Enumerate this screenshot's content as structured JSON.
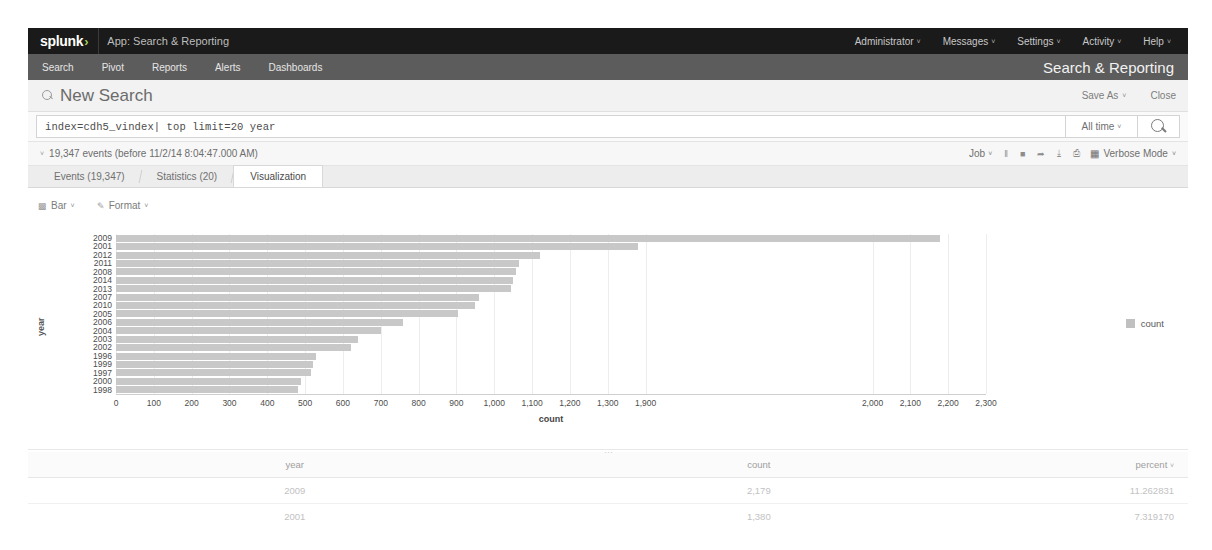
{
  "appbar": {
    "logo": "splunk",
    "logo_caret": "›",
    "app_label": "App: Search & Reporting",
    "right_items": [
      {
        "label": "Administrator",
        "caret": "˅"
      },
      {
        "label": "Messages",
        "caret": "˅"
      },
      {
        "label": "Settings",
        "caret": "˅"
      },
      {
        "label": "Activity",
        "caret": "˅"
      },
      {
        "label": "Help",
        "caret": "˅"
      }
    ]
  },
  "subnav": {
    "items": [
      {
        "label": "Search"
      },
      {
        "label": "Pivot"
      },
      {
        "label": "Reports"
      },
      {
        "label": "Alerts"
      },
      {
        "label": "Dashboards"
      }
    ],
    "app_title": "Search & Reporting"
  },
  "title_row": {
    "title": "New Search",
    "search_icon": "search-icon",
    "save_as": "Save As",
    "save_as_caret": "˅",
    "close": "Close"
  },
  "search": {
    "query": "index=cdh5_vindex| top limit=20 year",
    "time_range": "All time",
    "time_caret": "˅",
    "search_button_icon": "search-icon"
  },
  "results_header": {
    "expand_caret": "˅",
    "event_count_text": "19,347 events (before 11/2/14 8:04:47.000 AM)",
    "job_label": "Job",
    "job_caret": "˅",
    "controls": [
      {
        "icon": "pause-icon",
        "glyph": "‖"
      },
      {
        "icon": "stop-icon",
        "glyph": "■"
      },
      {
        "icon": "share-icon",
        "glyph": "➦"
      },
      {
        "icon": "export-icon",
        "glyph": "⤓"
      },
      {
        "icon": "print-icon",
        "glyph": "⎙"
      }
    ],
    "mode_icon": "grid-icon",
    "mode_label": "Verbose Mode",
    "mode_caret": "˅"
  },
  "tabs": [
    {
      "label": "Events (19,347)",
      "active": false
    },
    {
      "label": "Statistics (20)",
      "active": false
    },
    {
      "label": "Visualization",
      "active": true
    }
  ],
  "chart_toolbar": [
    {
      "icon": "bar-chart-icon",
      "label": "Bar",
      "caret": "˅"
    },
    {
      "icon": "format-icon",
      "label": "Format",
      "caret": "˅"
    }
  ],
  "chart_data": {
    "type": "bar",
    "orientation": "horizontal",
    "title": "",
    "xlabel": "count",
    "ylabel": "year",
    "xlim": [
      0,
      2300
    ],
    "grid": true,
    "legend_position": "right",
    "legend": [
      "count"
    ],
    "series_color": "#c8c8c8",
    "categories": [
      "2009",
      "2001",
      "2012",
      "2011",
      "2008",
      "2014",
      "2013",
      "2007",
      "2010",
      "2005",
      "2006",
      "2004",
      "2003",
      "2002",
      "1996",
      "1999",
      "1997",
      "2000",
      "1998"
    ],
    "values": [
      2179,
      1380,
      1120,
      1065,
      1058,
      1050,
      1045,
      960,
      950,
      905,
      760,
      700,
      640,
      620,
      530,
      520,
      515,
      490,
      480
    ],
    "xticks": [
      0,
      100,
      200,
      300,
      400,
      500,
      600,
      700,
      800,
      900,
      1000,
      1100,
      1200,
      1300,
      1400,
      2000,
      2100,
      2200,
      2300
    ],
    "xtick_labels": [
      "0",
      "100",
      "200",
      "300",
      "400",
      "500",
      "600",
      "700",
      "800",
      "900",
      "1,000",
      "1,100",
      "1,200",
      "1,300",
      "1,900",
      "2,000",
      "2,100",
      "2,200",
      "2,300"
    ]
  },
  "results_table": {
    "columns": [
      "year",
      "count",
      "percent"
    ],
    "sort_caret": "˅",
    "rows": [
      {
        "year": "2009",
        "count": "2,179",
        "percent": "11.262831"
      },
      {
        "year": "2001",
        "count": "1,380",
        "percent": "7.319170"
      }
    ]
  }
}
